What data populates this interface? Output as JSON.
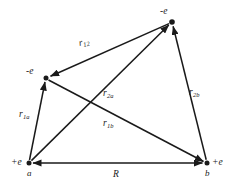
{
  "figure": {
    "kind": "vector-diagram",
    "ink_color": "#1a1a1a",
    "background_color": "#ffffff"
  },
  "nodes": [
    {
      "id": "proton-a",
      "charge_label": "+e",
      "name_label": "a",
      "x": 29,
      "y": 163
    },
    {
      "id": "proton-b",
      "charge_label": "+e",
      "name_label": "b",
      "x": 207,
      "y": 163
    },
    {
      "id": "electron-1",
      "charge_label": "-e",
      "name_label": "",
      "x": 46,
      "y": 78
    },
    {
      "id": "electron-2",
      "charge_label": "-e",
      "name_label": "",
      "x": 172,
      "y": 22
    }
  ],
  "edges": [
    {
      "id": "r12",
      "label_base": "r",
      "label_sub": "12",
      "from": "electron-2",
      "to": "electron-1",
      "label_x": 80,
      "label_y": 39
    },
    {
      "id": "r2a",
      "label_base": "r",
      "label_sub": "2a",
      "from": "proton-a",
      "to": "electron-2",
      "label_x": 103,
      "label_y": 89
    },
    {
      "id": "r2b",
      "label_base": "r",
      "label_sub": "2b",
      "from": "proton-b",
      "to": "electron-2",
      "label_x": 189,
      "label_y": 88
    },
    {
      "id": "r1a",
      "label_base": "r",
      "label_sub": "1a",
      "from": "proton-a",
      "to": "electron-1",
      "label_x": 19,
      "label_y": 110
    },
    {
      "id": "r1b",
      "label_base": "r",
      "label_sub": "1b",
      "from": "electron-1",
      "to": "proton-b",
      "label_x": 103,
      "label_y": 119
    },
    {
      "id": "R",
      "label_base": "R",
      "label_sub": "",
      "from": "proton-a",
      "to": "proton-b",
      "label_x": 113,
      "label_y": 170
    }
  ]
}
